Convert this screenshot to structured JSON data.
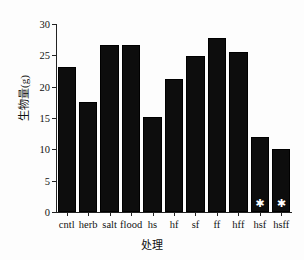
{
  "chart_data": {
    "type": "bar",
    "title": "",
    "xlabel": "处理",
    "ylabel": "生物量(g)",
    "categories": [
      "cntl",
      "herb",
      "salt",
      "flood",
      "hs",
      "hf",
      "sf",
      "ff",
      "hff",
      "hsf",
      "hsff"
    ],
    "values": [
      23.2,
      17.5,
      26.7,
      26.7,
      15.2,
      21.2,
      24.9,
      27.8,
      25.5,
      12.0,
      10.0
    ],
    "ylim": [
      0,
      30
    ],
    "yticks": [
      0,
      5,
      10,
      15,
      20,
      25,
      30
    ],
    "ytick_labels": [
      "0",
      "5",
      "10",
      "15",
      "20",
      "25",
      "30"
    ],
    "grid": false,
    "legend": null,
    "bar_color": "#0d0d0d",
    "annotations": [
      {
        "category": "hsf",
        "marker": "*",
        "position": "inside-bottom",
        "color": "#ffffff"
      },
      {
        "category": "hsff",
        "marker": "*",
        "position": "inside-bottom",
        "color": "#ffffff"
      }
    ],
    "annotation_marker": "✱"
  }
}
